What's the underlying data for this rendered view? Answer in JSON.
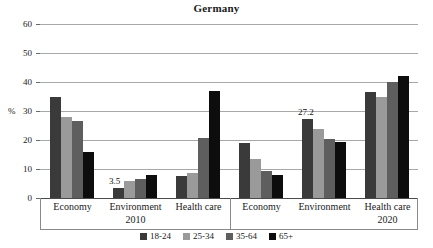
{
  "chart_data": {
    "type": "bar",
    "title": "Germany",
    "xlabel": "",
    "ylabel": "%",
    "ylim": [
      0,
      60
    ],
    "yticks": [
      0,
      10,
      20,
      30,
      40,
      50,
      60
    ],
    "grid": true,
    "legend_position": "bottom",
    "categories": [
      "Economy",
      "Environment",
      "Health care",
      "Economy",
      "Environment",
      "Health care"
    ],
    "panels": [
      {
        "label": "2010",
        "categories": [
          "Economy",
          "Environment",
          "Health care"
        ]
      },
      {
        "label": "2020",
        "categories": [
          "Economy",
          "Environment",
          "Health care"
        ]
      }
    ],
    "series": [
      {
        "name": "18-24",
        "color": "#3a3a3a",
        "values": [
          35.0,
          3.5,
          7.5,
          19.0,
          27.2,
          36.7
        ]
      },
      {
        "name": "25-34",
        "color": "#9a9a9a",
        "values": [
          28.0,
          6.0,
          8.6,
          13.4,
          23.8,
          34.8
        ]
      },
      {
        "name": "35-64",
        "color": "#5e5e5e",
        "values": [
          26.5,
          6.6,
          20.8,
          9.4,
          20.5,
          40.0
        ]
      },
      {
        "name": "65+",
        "color": "#0d0d0d",
        "values": [
          15.7,
          7.8,
          37.0,
          7.8,
          19.4,
          42.2
        ]
      }
    ],
    "annotations": [
      {
        "text": "3.5",
        "group": 1,
        "series": "18-24",
        "value": 3.5
      },
      {
        "text": "27.2",
        "group": 4,
        "series": "18-24",
        "value": 27.2
      }
    ]
  },
  "axis": {
    "unit_label": "%",
    "tick_labels": [
      "60",
      "50",
      "40",
      "30",
      "20",
      "10",
      "0"
    ]
  },
  "category_axis": {
    "panel_2010": {
      "items": [
        "Economy",
        "Environment",
        "Health care"
      ],
      "year": "2010"
    },
    "panel_2020": {
      "items": [
        "Economy",
        "Environment",
        "Health care"
      ],
      "year": "2020"
    }
  },
  "legend": {
    "items": [
      {
        "label": "18-24",
        "color": "#3a3a3a"
      },
      {
        "label": "25-34",
        "color": "#9a9a9a"
      },
      {
        "label": "35-64",
        "color": "#5e5e5e"
      },
      {
        "label": "65+",
        "color": "#0d0d0d"
      }
    ]
  }
}
